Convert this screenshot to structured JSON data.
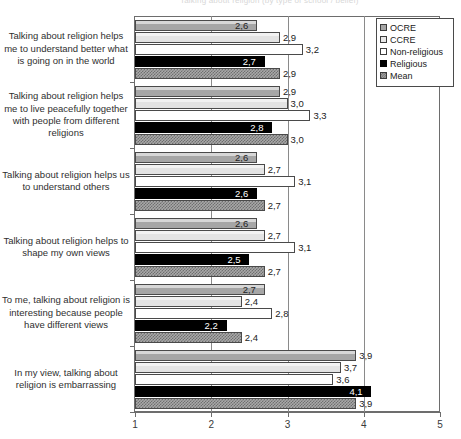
{
  "chart_data": {
    "type": "bar",
    "orientation": "horizontal",
    "title": "Talking about religion (by type of school / belief)",
    "xlabel": "",
    "ylabel": "",
    "xlim": [
      1,
      5
    ],
    "xticks": [
      "1",
      "2",
      "3",
      "4",
      "5"
    ],
    "grid": true,
    "legend_position": "top-right",
    "decimal_separator": ",",
    "categories": [
      "Talking about religion helps me to understand better what is going on in the world",
      "Talking about religion helps me to live peacefully together with people from different religions",
      "Talking about religion helps us to understand others",
      "Talking about religion helps to shape my own views",
      "To me, talking about religion is interesting because people have different views",
      "In my view, talking about religion is embarrassing"
    ],
    "series": [
      {
        "name": "OCRE",
        "color": "#a6a6a6",
        "values": [
          2.6,
          2.9,
          2.6,
          2.6,
          2.7,
          3.9
        ],
        "labels": [
          "2,6",
          "2,9",
          "2,6",
          "2,6",
          "2,7",
          "3,9"
        ]
      },
      {
        "name": "CCRE",
        "color": "#e3e3e3",
        "values": [
          2.9,
          3.0,
          2.7,
          2.7,
          2.4,
          3.7
        ],
        "labels": [
          "2,9",
          "3,0",
          "2,7",
          "2,7",
          "2,4",
          "3,7"
        ]
      },
      {
        "name": "Non-religious",
        "color": "#ffffff",
        "values": [
          3.2,
          3.3,
          3.1,
          3.1,
          2.8,
          3.6
        ],
        "labels": [
          "3,2",
          "3,3",
          "3,1",
          "3,1",
          "2,8",
          "3,6"
        ]
      },
      {
        "name": "Religious",
        "color": "#000000",
        "values": [
          2.7,
          2.8,
          2.6,
          2.5,
          2.2,
          4.1
        ],
        "labels": [
          "2,7",
          "2,8",
          "2,6",
          "2,5",
          "2,2",
          "4,1"
        ]
      },
      {
        "name": "Mean",
        "color": "#a8a8a8",
        "values": [
          2.9,
          3.0,
          2.7,
          2.7,
          2.4,
          3.9
        ],
        "labels": [
          "2,9",
          "3,0",
          "2,7",
          "2,7",
          "2,4",
          "3,9"
        ]
      }
    ]
  },
  "legend": {
    "items": [
      {
        "label": "OCRE",
        "swatch": "legend-swatch-ocre"
      },
      {
        "label": "CCRE",
        "swatch": "legend-swatch-ccre"
      },
      {
        "label": "Non-religious",
        "swatch": "legend-swatch-non-religious"
      },
      {
        "label": "Religious",
        "swatch": "legend-swatch-religious"
      },
      {
        "label": "Mean",
        "swatch": "legend-swatch-mean"
      }
    ]
  }
}
